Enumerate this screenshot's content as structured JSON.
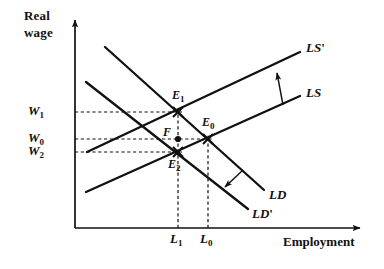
{
  "figure": {
    "kind": "labor-market-supply-demand-diagram",
    "background_color": "#ffffff",
    "line_color": "#111111"
  },
  "axes": {
    "y_title_line1": "Real",
    "y_title_line2": "wage",
    "x_title": "Employment",
    "origin": {
      "x": 75,
      "y": 228
    },
    "y_axis_top": 18,
    "x_axis_right": 362
  },
  "y_ticks": [
    {
      "name": "W1",
      "base": "W",
      "subscript": "1",
      "y": 112,
      "dash_to_x": 182
    },
    {
      "name": "W0",
      "base": "W",
      "subscript": "0",
      "y": 139,
      "dash_to_x": 212
    },
    {
      "name": "W2",
      "base": "W",
      "subscript": "2",
      "y": 152,
      "dash_to_x": 182
    }
  ],
  "x_ticks": [
    {
      "name": "L1",
      "base": "L",
      "subscript": "1",
      "x": 178,
      "dash_to_y": 116
    },
    {
      "name": "L0",
      "base": "L",
      "subscript": "0",
      "x": 208,
      "dash_to_y": 141
    }
  ],
  "curves": [
    {
      "name": "LS-prime",
      "label_base": "LS",
      "label_prime": "'",
      "type": "supply",
      "x1": 87,
      "y1": 152,
      "x2": 300,
      "y2": 52,
      "label_x": 306,
      "label_y": 41
    },
    {
      "name": "LS",
      "label_base": "LS",
      "label_prime": "",
      "type": "supply",
      "x1": 86,
      "y1": 192,
      "x2": 300,
      "y2": 96,
      "label_x": 306,
      "label_y": 86
    },
    {
      "name": "LD",
      "label_base": "LD",
      "label_prime": "",
      "type": "demand",
      "x1": 105,
      "y1": 47,
      "x2": 264,
      "y2": 190,
      "label_x": 269,
      "label_y": 188
    },
    {
      "name": "LD-prime",
      "label_base": "LD",
      "label_prime": "'",
      "type": "demand",
      "x1": 86,
      "y1": 82,
      "x2": 248,
      "y2": 209,
      "label_x": 252,
      "label_y": 207
    }
  ],
  "shift_arrows": [
    {
      "name": "supply-shift-arrow",
      "direction": "up-left",
      "x1": 283,
      "y1": 105,
      "x2": 276,
      "y2": 69
    },
    {
      "name": "demand-shift-arrow",
      "direction": "down-left",
      "x1": 243,
      "y1": 170,
      "x2": 222,
      "y2": 189
    }
  ],
  "points": [
    {
      "name": "E1",
      "base": "E",
      "subscript": "1",
      "x": 178,
      "y": 112,
      "marker": "cross",
      "label_x": 172,
      "label_y": 89
    },
    {
      "name": "E0",
      "base": "E",
      "subscript": "0",
      "x": 208,
      "y": 139,
      "marker": "cross",
      "label_x": 202,
      "label_y": 116
    },
    {
      "name": "F",
      "base": "F",
      "subscript": "",
      "x": 178,
      "y": 139,
      "marker": "dot",
      "label_x": 163,
      "label_y": 126
    },
    {
      "name": "E2",
      "base": "E",
      "subscript": "2",
      "x": 178,
      "y": 152,
      "marker": "cross",
      "label_x": 168,
      "label_y": 158
    }
  ]
}
